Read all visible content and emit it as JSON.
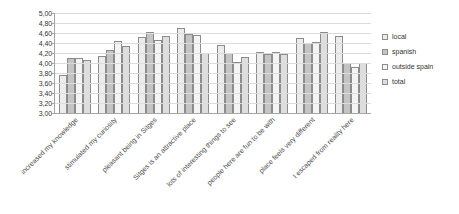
{
  "chart_data": {
    "type": "bar",
    "title": "",
    "xlabel": "",
    "ylabel": "",
    "ylim": [
      3.0,
      5.0
    ],
    "ytick_step": 0.2,
    "grid": true,
    "legend_position": "right",
    "decimal_separator": ",",
    "ytick_labels": [
      "5,00",
      "4,80",
      "4,60",
      "4,40",
      "4,20",
      "4,00",
      "3,80",
      "3,60",
      "3,40",
      "3,20",
      "3,00"
    ],
    "ytick_values": [
      5.0,
      4.8,
      4.6,
      4.4,
      4.2,
      4.0,
      3.8,
      3.6,
      3.4,
      3.2,
      3.0
    ],
    "categories": [
      "increased my knowledge",
      "stimulated my curiosity",
      "pleasant being in Sitges",
      "Sitges is an attractive place",
      "lots of interesting things to see",
      "people here are fun to be with",
      "place feels very different",
      "I escaped from reality here"
    ],
    "series": [
      {
        "name": "local",
        "values": [
          3.76,
          4.15,
          4.52,
          4.7,
          4.36,
          4.22,
          4.5,
          4.55
        ]
      },
      {
        "name": "spanish",
        "values": [
          4.1,
          4.26,
          4.62,
          4.58,
          4.2,
          4.18,
          4.4,
          4.0
        ]
      },
      {
        "name": "outside spain",
        "values": [
          4.1,
          4.45,
          4.47,
          4.56,
          4.02,
          4.23,
          4.42,
          3.93
        ]
      },
      {
        "name": "total",
        "values": [
          4.06,
          4.34,
          4.55,
          4.2,
          4.12,
          4.18,
          4.62,
          4.0
        ]
      }
    ]
  },
  "legend": {
    "items": [
      {
        "label": "local"
      },
      {
        "label": "spanish"
      },
      {
        "label": "outside spain"
      },
      {
        "label": "total"
      }
    ]
  },
  "colors": {
    "series_local": "#ececec",
    "series_spanish": "#c4c4c4",
    "series_outside_spain": "#f4f4f4",
    "series_total": "#dedede",
    "bar_border": "#8c8c8c",
    "gridline": "#dcdcdc",
    "axis": "#a6a6a6",
    "text": "#333333"
  }
}
